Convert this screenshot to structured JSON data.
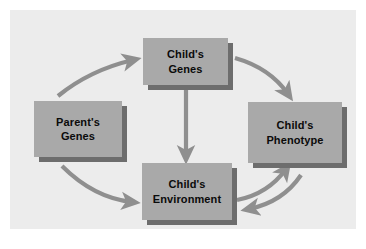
{
  "figure": {
    "type": "cycle-diagram",
    "panel_background_color": "#ececec",
    "outer_background_color": "#ffffff",
    "box_fill_color": "#a9a9a9",
    "box_shadow_color": "#6d6d6d",
    "arrow_color": "#8f8f8f",
    "label_color": "#0b0b0b"
  },
  "nodes": [
    {
      "id": "childs-genes",
      "label": "Child's\nGenes",
      "line1": "Child's",
      "line2": "Genes",
      "position": "top-center"
    },
    {
      "id": "parents-genes",
      "label": "Parent's\nGenes",
      "line1": "Parent's",
      "line2": "Genes",
      "position": "left"
    },
    {
      "id": "childs-phenotype",
      "label": "Child's\nPhenotype",
      "line1": "Child's",
      "line2": "Phenotype",
      "position": "right"
    },
    {
      "id": "childs-environment",
      "label": "Child's\nEnvironment",
      "line1": "Child's",
      "line2": "Environment",
      "position": "bottom-center"
    }
  ],
  "edges": [
    {
      "id": "parents-genes-to-childs-genes",
      "from": "parents-genes",
      "to": "childs-genes",
      "style": "curved",
      "direction": "up-right",
      "bidirectional": false
    },
    {
      "id": "childs-genes-to-childs-phenotype",
      "from": "childs-genes",
      "to": "childs-phenotype",
      "style": "curved",
      "direction": "down-right",
      "bidirectional": false
    },
    {
      "id": "childs-genes-to-childs-environment",
      "from": "childs-genes",
      "to": "childs-environment",
      "style": "straight",
      "direction": "down",
      "bidirectional": false
    },
    {
      "id": "parents-genes-to-childs-environment",
      "from": "parents-genes",
      "to": "childs-environment",
      "style": "curved",
      "direction": "down-right",
      "bidirectional": false
    },
    {
      "id": "childs-environment-to-childs-phenotype",
      "from": "childs-environment",
      "to": "childs-phenotype",
      "style": "curved",
      "direction": "up-right",
      "bidirectional": false
    },
    {
      "id": "childs-phenotype-to-childs-environment",
      "from": "childs-phenotype",
      "to": "childs-environment",
      "style": "curved",
      "direction": "down-left",
      "bidirectional": false
    }
  ]
}
